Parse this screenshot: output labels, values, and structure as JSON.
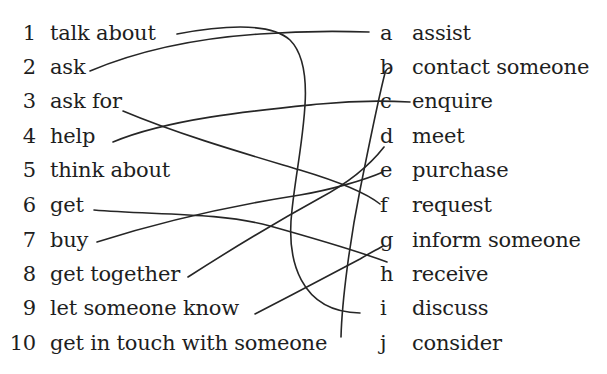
{
  "exercise": {
    "left_items": [
      {
        "num": "1",
        "text": "talk about"
      },
      {
        "num": "2",
        "text": "ask"
      },
      {
        "num": "3",
        "text": "ask for"
      },
      {
        "num": "4",
        "text": "help"
      },
      {
        "num": "5",
        "text": "think about"
      },
      {
        "num": "6",
        "text": "get"
      },
      {
        "num": "7",
        "text": "buy"
      },
      {
        "num": "8",
        "text": "get together"
      },
      {
        "num": "9",
        "text": "let someone know"
      },
      {
        "num": "10",
        "text": "get in touch with someone"
      }
    ],
    "right_items": [
      {
        "letter": "a",
        "text": "assist"
      },
      {
        "letter": "b",
        "text": "contact someone"
      },
      {
        "letter": "c",
        "text": "enquire"
      },
      {
        "letter": "d",
        "text": "meet"
      },
      {
        "letter": "e",
        "text": "purchase"
      },
      {
        "letter": "f",
        "text": "request"
      },
      {
        "letter": "g",
        "text": "inform someone"
      },
      {
        "letter": "h",
        "text": "receive"
      },
      {
        "letter": "i",
        "text": "discuss"
      },
      {
        "letter": "j",
        "text": "consider"
      }
    ],
    "drawn_matches": [
      {
        "from": "1",
        "to": "i"
      },
      {
        "from": "2",
        "to": "a"
      },
      {
        "from": "3",
        "to": "f"
      },
      {
        "from": "4",
        "to": "c"
      },
      {
        "from": "6",
        "to": "h"
      },
      {
        "from": "7",
        "to": "e"
      },
      {
        "from": "8",
        "to": "d"
      },
      {
        "from": "9",
        "to": "g"
      },
      {
        "from": "10",
        "to": "b"
      }
    ]
  }
}
